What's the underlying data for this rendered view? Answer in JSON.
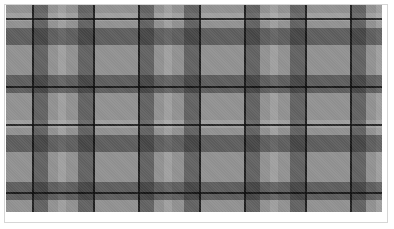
{
  "image": {
    "subject": "grayscale plaid tartan fabric pattern",
    "colors": {
      "base": "#8f8f8f",
      "dark_band": "#3a3a3a",
      "line": "#0a0a0a",
      "light_band": "#b5b5b5",
      "frame_border": "#d6d6d6",
      "background": "#ffffff"
    }
  }
}
